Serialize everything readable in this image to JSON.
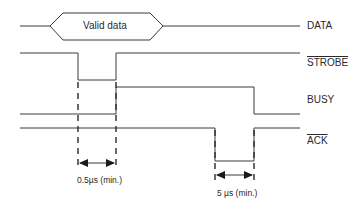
{
  "diagram": {
    "type": "timing-diagram",
    "signals": [
      {
        "name": "DATA",
        "overline": false,
        "label": "DATA"
      },
      {
        "name": "STROBE",
        "overline": true,
        "label": "STROBE"
      },
      {
        "name": "BUSY",
        "overline": false,
        "label": "BUSY"
      },
      {
        "name": "ACK",
        "overline": true,
        "label": "ACK"
      }
    ],
    "data_bus_label": "Valid data",
    "annotations": [
      {
        "id": "strobe-width",
        "label": "0.5µs (min.)"
      },
      {
        "id": "ack-width",
        "label": "5 µs (min.)"
      }
    ],
    "colors": {
      "line": "#3a3a3a",
      "text": "#2a2a2a",
      "background": "#ffffff"
    }
  }
}
